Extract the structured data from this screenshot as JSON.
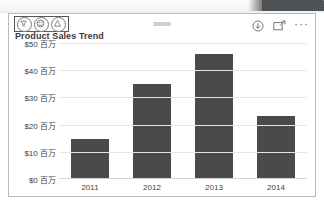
{
  "window": {
    "chrome_accent_color": "#4f5254",
    "background_color": "#ffffff"
  },
  "card": {
    "header": {
      "icon_group": [
        {
          "name": "filter-icon",
          "label": "Filters"
        },
        {
          "name": "focus-face-icon",
          "label": "Focus"
        },
        {
          "name": "info-icon",
          "label": "Info"
        }
      ],
      "center_dash_label": "",
      "actions": [
        {
          "name": "download-icon",
          "label": "Download"
        },
        {
          "name": "focus-mode-icon",
          "label": "Focus mode"
        },
        {
          "name": "more-options-icon",
          "label": "···"
        }
      ]
    },
    "title": "Product Sales Trend"
  },
  "chart_data": {
    "type": "bar",
    "title": "Product Sales Trend",
    "xlabel": "",
    "ylabel": "",
    "categories": [
      "2011",
      "2012",
      "2013",
      "2014"
    ],
    "values": [
      14.6,
      35,
      46,
      23
    ],
    "ylim": [
      0,
      50
    ],
    "y_ticks": [
      50,
      40,
      30,
      20,
      10,
      0
    ],
    "y_tick_labels": [
      "$50 百万",
      "$40 百万",
      "$30 百万",
      "$20 百万",
      "$10 百万",
      "$0 百万"
    ],
    "x_tick_labels": [
      "2011",
      "2012",
      "2013",
      "2014"
    ],
    "series": [
      {
        "name": "Sales",
        "values": [
          14.6,
          35,
          46,
          23
        ],
        "color": "#4a4a4a"
      }
    ],
    "grid": true,
    "legend": false,
    "bar_color": "#4a4a4a",
    "gridline_color": "#e6e6e6"
  }
}
